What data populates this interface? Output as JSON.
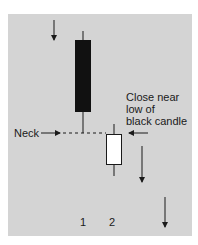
{
  "diagram": {
    "type": "candlestick-pattern",
    "annotation": [
      "Close near",
      "low of",
      "black candle"
    ],
    "neck_label": "Neck",
    "candle_labels": [
      "1",
      "2"
    ],
    "candles": [
      {
        "id": "1",
        "color": "black",
        "body_top": 40,
        "body_bottom": 112,
        "wick_top": 31,
        "wick_bottom": 133
      },
      {
        "id": "2",
        "color": "white",
        "body_top": 134,
        "body_bottom": 164,
        "wick_top": 124,
        "wick_bottom": 176
      }
    ],
    "colors": {
      "background": "#d4d4d4",
      "ink": "#1a1a1a",
      "white_candle": "#ffffff"
    }
  }
}
